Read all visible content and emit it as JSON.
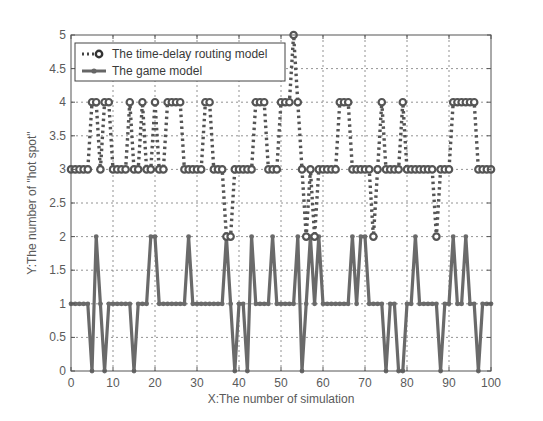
{
  "chart_data": {
    "type": "line",
    "title": "",
    "xlabel": "X:The number of simulation",
    "ylabel": "Y:The number of \"hot spot\"",
    "xlim": [
      0,
      100
    ],
    "ylim": [
      0,
      5
    ],
    "xticks": [
      0,
      10,
      20,
      30,
      40,
      50,
      60,
      70,
      80,
      90,
      100
    ],
    "yticks": [
      0,
      0.5,
      1,
      1.5,
      2,
      2.5,
      3,
      3.5,
      4,
      4.5,
      5
    ],
    "ytick_labels": [
      "0",
      "0.5",
      "1",
      "1.5",
      "2",
      "2.5",
      "3",
      "3.5",
      "4",
      "4.5",
      "5"
    ],
    "grid": true,
    "legend_position": "upper left",
    "x": [
      0,
      1,
      2,
      3,
      4,
      5,
      6,
      7,
      8,
      9,
      10,
      11,
      12,
      13,
      14,
      15,
      16,
      17,
      18,
      19,
      20,
      21,
      22,
      23,
      24,
      25,
      26,
      27,
      28,
      29,
      30,
      31,
      32,
      33,
      34,
      35,
      36,
      37,
      38,
      39,
      40,
      41,
      42,
      43,
      44,
      45,
      46,
      47,
      48,
      49,
      50,
      51,
      52,
      53,
      54,
      55,
      56,
      57,
      58,
      59,
      60,
      61,
      62,
      63,
      64,
      65,
      66,
      67,
      68,
      69,
      70,
      71,
      72,
      73,
      74,
      75,
      76,
      77,
      78,
      79,
      80,
      81,
      82,
      83,
      84,
      85,
      86,
      87,
      88,
      89,
      90,
      91,
      92,
      93,
      94,
      95,
      96,
      97,
      98,
      99,
      100
    ],
    "series": [
      {
        "name": "The time-delay routing model",
        "style": "dotted",
        "marker": "circle",
        "color": "#555555",
        "values": [
          3,
          3,
          3,
          3,
          3,
          4,
          4,
          3,
          4,
          4,
          3,
          3,
          3,
          3,
          4,
          3,
          3,
          4,
          3,
          3,
          4,
          3,
          3,
          4,
          4,
          4,
          4,
          3,
          3,
          3,
          3,
          3,
          4,
          4,
          3,
          3,
          3,
          2,
          2,
          3,
          3,
          3,
          3,
          3,
          4,
          4,
          4,
          3,
          3,
          3,
          4,
          4,
          4,
          5,
          4,
          3,
          2,
          3,
          2,
          3,
          3,
          3,
          3,
          3,
          4,
          4,
          4,
          3,
          3,
          3,
          3,
          3,
          2,
          3,
          4,
          3,
          3,
          3,
          3,
          4,
          3,
          3,
          3,
          3,
          3,
          3,
          3,
          2,
          3,
          3,
          3,
          4,
          4,
          4,
          4,
          4,
          4,
          3,
          3,
          3,
          3
        ]
      },
      {
        "name": "The game model",
        "style": "solid",
        "marker": "diamond",
        "color": "#6a6a6a",
        "values": [
          1,
          1,
          1,
          1,
          1,
          0,
          2,
          1,
          0,
          1,
          1,
          1,
          1,
          1,
          1,
          0,
          1,
          1,
          1,
          2,
          2,
          1,
          1,
          1,
          1,
          1,
          1,
          1,
          2,
          1,
          1,
          1,
          1,
          1,
          1,
          1,
          1,
          2,
          1,
          0,
          1,
          1,
          0,
          2,
          1,
          1,
          1,
          1,
          2,
          1,
          1,
          1,
          1,
          1,
          2,
          0,
          1,
          2,
          1,
          2,
          1,
          1,
          1,
          1,
          1,
          1,
          1,
          2,
          1,
          2,
          2,
          1,
          1,
          1,
          1,
          0,
          1,
          1,
          0,
          0,
          1,
          1,
          2,
          1,
          1,
          1,
          1,
          1,
          0,
          1,
          1,
          2,
          1,
          1,
          2,
          1,
          1,
          0,
          1,
          1,
          1
        ]
      }
    ]
  }
}
